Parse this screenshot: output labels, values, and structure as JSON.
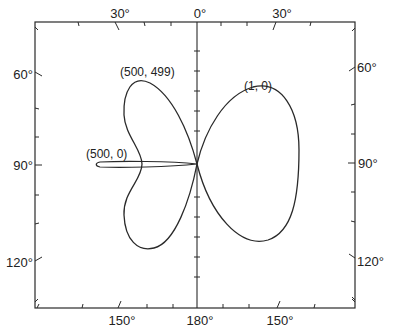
{
  "diagram": {
    "type": "polar-radiation-pattern",
    "frame": {
      "left": 35,
      "top": 22,
      "right": 355,
      "bottom": 308,
      "center_x": 197,
      "center_y": 164
    },
    "colors": {
      "line": "#2a2a2a",
      "background": "#ffffff",
      "text": "#222222"
    },
    "top_labels": [
      {
        "text": "30°",
        "x": 120,
        "y": 18
      },
      {
        "text": "0°",
        "x": 197,
        "y": 18
      },
      {
        "text": "30°",
        "x": 279,
        "y": 18
      }
    ],
    "bottom_labels": [
      {
        "text": "150°",
        "x": 120,
        "y": 324
      },
      {
        "text": "180°",
        "x": 197,
        "y": 324
      },
      {
        "text": "150°",
        "x": 275,
        "y": 324
      }
    ],
    "left_labels": [
      {
        "text": "60°",
        "x": 26,
        "y": 78
      },
      {
        "text": "90°",
        "x": 26,
        "y": 168
      },
      {
        "text": "120°",
        "x": 26,
        "y": 262
      }
    ],
    "right_labels": [
      {
        "text": "60°",
        "x": 361,
        "y": 72
      },
      {
        "text": "90°",
        "x": 361,
        "y": 168
      },
      {
        "text": "120°",
        "x": 361,
        "y": 262
      }
    ],
    "curves": [
      {
        "name": "(1, 0)",
        "label_x": 244,
        "label_y": 92
      },
      {
        "name": "(500, 499)",
        "label_x": 120,
        "label_y": 76
      },
      {
        "name": "(500, 0)",
        "label_x": 86,
        "label_y": 160
      }
    ]
  }
}
